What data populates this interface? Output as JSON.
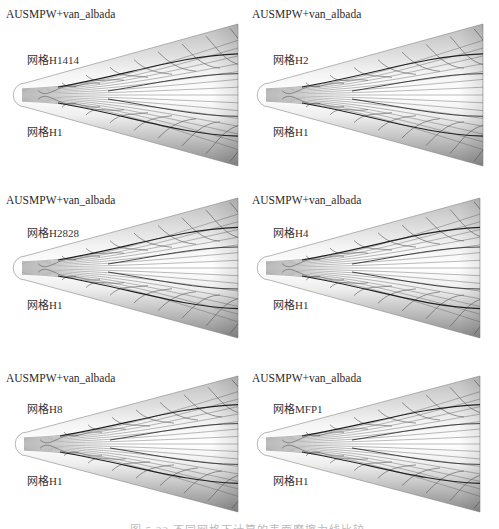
{
  "figure": {
    "panels": [
      {
        "scheme": "AUSMPW+van_albada",
        "grid_top": "网格H1414",
        "grid_bottom": "网格H1"
      },
      {
        "scheme": "AUSMPW+van_albada",
        "grid_top": "网格H2",
        "grid_bottom": "网格H1"
      },
      {
        "scheme": "AUSMPW+van_albada",
        "grid_top": "网格H2828",
        "grid_bottom": "网格H1"
      },
      {
        "scheme": "AUSMPW+van_albada",
        "grid_top": "网格H4",
        "grid_bottom": "网格H1"
      },
      {
        "scheme": "AUSMPW+van_albada",
        "grid_top": "网格H8",
        "grid_bottom": "网格H1"
      },
      {
        "scheme": "AUSMPW+van_albada",
        "grid_top": "网格MFP1",
        "grid_bottom": "网格H1"
      }
    ],
    "caption": "图 5.22  不同网格下计算的表面摩擦力线比较"
  }
}
